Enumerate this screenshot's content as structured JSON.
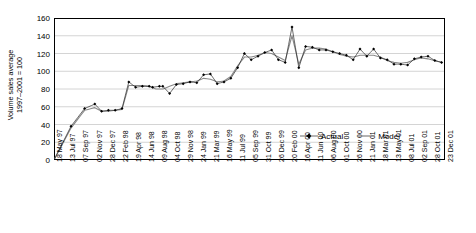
{
  "chart_data": {
    "type": "line",
    "title": "",
    "xlabel": "",
    "ylabel": "Volume sales average 1997–2001 = 100",
    "ylabel_lines": [
      "Volume sales average",
      "1997–2001 = 100"
    ],
    "ylim": [
      0,
      160
    ],
    "yticks": [
      0,
      20,
      40,
      60,
      80,
      100,
      120,
      140,
      160
    ],
    "grid": "horizontal",
    "legend_position": "bottom-center",
    "legend": [
      "Actual",
      "Model"
    ],
    "x": [
      "18 May 97",
      "13 Jul 97",
      "07 Sep 97",
      "02 Nov 97",
      "28 Dec 97",
      "22 Feb 98",
      "19 Apr 98",
      "14 Jun 98",
      "09 Aug 98",
      "04 Oct 98",
      "29 Nov 98",
      "24 Jan 99",
      "21 Mar 99",
      "16 May 99",
      "11 Jul 99",
      "05 Sep 99",
      "31 Oct 99",
      "26 Dec 99",
      "20 Feb 00",
      "16 Apr 00",
      "11 Jun 00",
      "06 Aug 00",
      "01 Oct 00",
      "26 Nov 00",
      "21 Jan 01",
      "18 Mar 01",
      "13 May 01",
      "08 Jul 01",
      "02 Sep 01",
      "28 Oct 01",
      "23 Dec 01"
    ],
    "x_tick_step_weeks": 8,
    "series": [
      {
        "name": "Actual",
        "marker": "diamond",
        "color": "#000000",
        "values": [
          0,
          null,
          null,
          null,
          null,
          null,
          58,
          63,
          null,
          null,
          null,
          null,
          null,
          null,
          null,
          null,
          null,
          null,
          null,
          null,
          null,
          null,
          null,
          null,
          null,
          null,
          null,
          null,
          null,
          null,
          null
        ]
      },
      {
        "name": "Model",
        "marker": "none",
        "color": "#808080",
        "values": [
          0,
          null,
          null,
          null,
          null,
          null,
          57,
          60,
          null,
          null,
          null,
          null,
          null,
          null,
          null,
          null,
          null,
          null,
          null,
          null,
          null,
          null,
          null,
          null,
          null,
          null,
          null,
          null,
          null,
          null,
          null
        ]
      }
    ],
    "actual_points": [
      [
        0,
        0
      ],
      [
        5,
        38
      ],
      [
        9,
        58
      ],
      [
        12,
        63
      ],
      [
        14,
        55
      ],
      [
        16,
        56
      ],
      [
        18,
        56
      ],
      [
        20,
        58
      ],
      [
        22,
        88
      ],
      [
        24,
        82
      ],
      [
        26,
        83
      ],
      [
        28,
        83
      ],
      [
        29,
        82
      ],
      [
        31,
        83
      ],
      [
        32,
        83
      ],
      [
        34,
        75
      ],
      [
        36,
        85
      ],
      [
        38,
        86
      ],
      [
        40,
        88
      ],
      [
        42,
        87
      ],
      [
        44,
        96
      ],
      [
        46,
        97
      ],
      [
        48,
        86
      ],
      [
        50,
        88
      ],
      [
        52,
        92
      ],
      [
        54,
        104
      ],
      [
        56,
        120
      ],
      [
        58,
        113
      ],
      [
        60,
        117
      ],
      [
        62,
        121
      ],
      [
        64,
        124
      ],
      [
        66,
        113
      ],
      [
        68,
        110
      ],
      [
        70,
        150
      ],
      [
        72,
        104
      ],
      [
        74,
        128
      ],
      [
        76,
        127
      ],
      [
        78,
        124
      ],
      [
        80,
        124
      ],
      [
        82,
        122
      ],
      [
        84,
        120
      ],
      [
        86,
        118
      ],
      [
        88,
        113
      ],
      [
        90,
        125
      ],
      [
        92,
        117
      ],
      [
        94,
        125
      ],
      [
        96,
        115
      ],
      [
        98,
        113
      ],
      [
        100,
        108
      ],
      [
        102,
        108
      ],
      [
        104,
        107
      ],
      [
        106,
        114
      ],
      [
        108,
        116
      ],
      [
        110,
        117
      ],
      [
        112,
        112
      ],
      [
        114,
        110
      ]
    ],
    "model_points": [
      [
        0,
        0
      ],
      [
        5,
        36
      ],
      [
        9,
        56
      ],
      [
        12,
        59
      ],
      [
        14,
        55
      ],
      [
        16,
        55
      ],
      [
        18,
        56
      ],
      [
        20,
        57
      ],
      [
        22,
        84
      ],
      [
        24,
        84
      ],
      [
        26,
        84
      ],
      [
        28,
        83
      ],
      [
        30,
        80
      ],
      [
        32,
        80
      ],
      [
        34,
        83
      ],
      [
        36,
        86
      ],
      [
        38,
        87
      ],
      [
        40,
        88
      ],
      [
        42,
        89
      ],
      [
        44,
        92
      ],
      [
        46,
        91
      ],
      [
        48,
        88
      ],
      [
        50,
        89
      ],
      [
        52,
        94
      ],
      [
        54,
        106
      ],
      [
        56,
        116
      ],
      [
        58,
        116
      ],
      [
        60,
        118
      ],
      [
        62,
        121
      ],
      [
        64,
        120
      ],
      [
        66,
        116
      ],
      [
        68,
        112
      ],
      [
        70,
        140
      ],
      [
        72,
        108
      ],
      [
        74,
        124
      ],
      [
        76,
        126
      ],
      [
        78,
        126
      ],
      [
        80,
        125
      ],
      [
        82,
        122
      ],
      [
        84,
        119
      ],
      [
        86,
        117
      ],
      [
        88,
        116
      ],
      [
        90,
        118
      ],
      [
        92,
        118
      ],
      [
        94,
        118
      ],
      [
        96,
        116
      ],
      [
        98,
        112
      ],
      [
        100,
        110
      ],
      [
        102,
        109
      ],
      [
        104,
        110
      ],
      [
        106,
        113
      ],
      [
        108,
        115
      ],
      [
        110,
        114
      ],
      [
        112,
        112
      ],
      [
        114,
        110
      ]
    ],
    "n_periods": 116,
    "x_index_range": [
      0,
      115
    ]
  },
  "legend_items": [
    {
      "label": "Actual",
      "symbol": "marker-line"
    },
    {
      "label": "Model",
      "symbol": "line"
    }
  ]
}
